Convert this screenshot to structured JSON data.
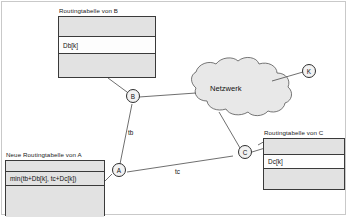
{
  "diagram": {
    "title_b_table": "Routingtabelle von B",
    "title_a_table": "Neue Routingtabelle von A",
    "title_c_table": "Routingtabelle von C",
    "cloud_label": "Netzwerk",
    "tables": {
      "b": {
        "title": "Routingtabelle von B",
        "rows": [
          {
            "text": "",
            "shaded": true
          },
          {
            "text": "Db[k]",
            "shaded": false
          },
          {
            "text": "",
            "shaded": true
          }
        ]
      },
      "a": {
        "title": "Neue Routingtabelle von A",
        "rows": [
          {
            "text": "",
            "shaded": true
          },
          {
            "text": "min(tb+Db[k], tc+Dc[k])",
            "shaded": true
          },
          {
            "text": "",
            "shaded": true
          }
        ]
      },
      "c": {
        "title": "Routingtabelle von C",
        "rows": [
          {
            "text": "",
            "shaded": true
          },
          {
            "text": "Dc[k]",
            "shaded": false
          },
          {
            "text": "",
            "shaded": true
          }
        ]
      }
    },
    "nodes": [
      {
        "id": "B",
        "label": "B"
      },
      {
        "id": "A",
        "label": "A"
      },
      {
        "id": "C",
        "label": "C"
      },
      {
        "id": "K",
        "label": "K"
      }
    ],
    "edge_labels": [
      {
        "id": "tb",
        "label": "tb"
      },
      {
        "id": "tc",
        "label": "tc"
      }
    ],
    "colors": {
      "stroke": "#2e2e2e",
      "table_fill": "#e2e2e2",
      "row_white": "#fdfdfd",
      "cloud_fill": "#e8e8e8",
      "frame": "#c9c9c9"
    }
  }
}
